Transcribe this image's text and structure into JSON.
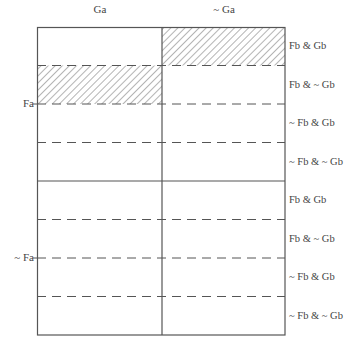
{
  "diagram": {
    "columns": [
      {
        "label": "Ga"
      },
      {
        "label": "~ Ga"
      }
    ],
    "major_rows": [
      {
        "label": "Fa"
      },
      {
        "label": "~ Fa"
      }
    ],
    "sub_rows": [
      {
        "label": "Fb & Gb"
      },
      {
        "label": "Fb & ~ Gb"
      },
      {
        "label": "~ Fb & Gb"
      },
      {
        "label": "~ Fb & ~ Gb"
      },
      {
        "label": "Fb & Gb"
      },
      {
        "label": "Fb & ~ Gb"
      },
      {
        "label": "~ Fb & Gb"
      },
      {
        "label": "~ Fb & ~ Gb"
      }
    ],
    "hatched_cells": [
      {
        "column": "Ga",
        "major_row": "Fa",
        "sub_row": "Fb & ~ Gb"
      },
      {
        "column": "~ Ga",
        "major_row": "Fa",
        "sub_row": "Fb & Gb"
      }
    ],
    "colors": {
      "line": "#555555",
      "hatch": "#6a6a6a",
      "background": "#ffffff"
    }
  }
}
